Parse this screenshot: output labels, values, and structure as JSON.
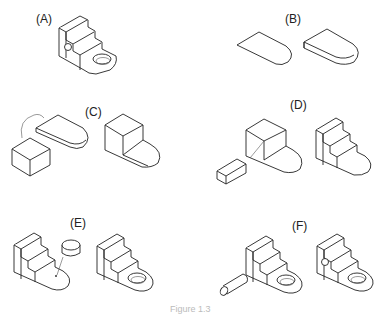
{
  "figure": {
    "panels": [
      {
        "id": "A",
        "label": "(A)",
        "description": "Finished part: stepped block with hole in base tab and small hole on side"
      },
      {
        "id": "B",
        "label": "(B)",
        "description": "Sketch base profile then extrude into rounded-end slab"
      },
      {
        "id": "C",
        "label": "(C)",
        "description": "Add box to slab"
      },
      {
        "id": "D",
        "label": "(D)",
        "description": "Cut rectangular step to form stairs"
      },
      {
        "id": "E",
        "label": "(E)",
        "description": "Cut cylindrical hole through tab"
      },
      {
        "id": "F",
        "label": "(F)",
        "description": "Cut cylinder hole on side face"
      }
    ],
    "caption_partial": "Figure 1.3"
  }
}
